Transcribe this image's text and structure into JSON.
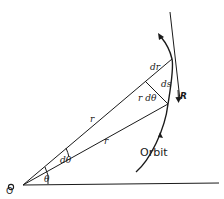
{
  "diagram": {
    "labels": {
      "origin": "O",
      "theta": "θ",
      "dtheta": "dθ",
      "r_upper": "r",
      "r_lower": "r",
      "dr": "dr",
      "ds": "ds",
      "r_dtheta": "r dθ",
      "R": "R",
      "orbit": "Orbit"
    },
    "colors": {
      "ink": "#1a1a1a",
      "background": "#ffffff"
    }
  }
}
